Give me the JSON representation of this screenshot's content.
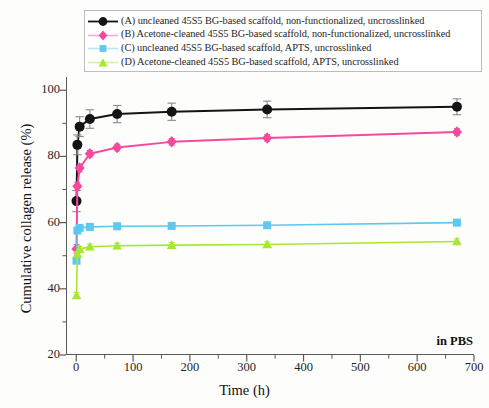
{
  "figure": {
    "background_color": "#fdfdfc",
    "axis_color": "#5a5a5a"
  },
  "annotation": {
    "in_pbs": "in PBS"
  },
  "legend": {
    "border_color": "#bdbdbd",
    "entries": [
      {
        "key": "A",
        "label": "(A) uncleaned 45S5 BG-based scaffold, non-functionalized, uncrosslinked",
        "color": "#141414",
        "marker": "circle"
      },
      {
        "key": "B",
        "label": "(B) Acetone-cleaned 45S5 BG-based scaffold, non-functionalized, uncrosslinked",
        "color": "#f54a9c",
        "marker": "diamond"
      },
      {
        "key": "C",
        "label": "(C) uncleaned 45S5 BG-based scaffold, APTS, uncrosslinked",
        "color": "#5ec8f0",
        "marker": "square"
      },
      {
        "key": "D",
        "label": "(D) Acetone-cleaned 45S5 BG-based scaffold, APTS, uncrosslinked",
        "color": "#a6e831",
        "marker": "triangle"
      }
    ]
  },
  "chart_data": {
    "type": "line",
    "title": "",
    "xlabel": "Time (h)",
    "ylabel": "Cumulative collagen release (%)",
    "xlim": [
      -18,
      700
    ],
    "ylim": [
      20,
      104
    ],
    "xticks": [
      0,
      100,
      200,
      300,
      400,
      500,
      600,
      700
    ],
    "yticks": [
      20,
      40,
      60,
      80,
      100
    ],
    "xminor_step": 50,
    "yminor_step": 10,
    "grid": false,
    "legend_position": "above-plot",
    "x": [
      0.5,
      2,
      6,
      24,
      72,
      168,
      336,
      670
    ],
    "series": [
      {
        "name": "(A) uncleaned 45S5 BG-based scaffold, non-functionalized, uncrosslinked",
        "key": "A",
        "color": "#141414",
        "marker": "circle",
        "values": [
          66.5,
          83.5,
          89.0,
          91.3,
          92.8,
          93.5,
          94.2,
          95.0
        ],
        "errors": [
          3.2,
          3.0,
          3.0,
          2.8,
          2.6,
          2.6,
          2.5,
          2.4
        ]
      },
      {
        "name": "(B) Acetone-cleaned 45S5 BG-based scaffold, non-functionalized, uncrosslinked",
        "key": "B",
        "color": "#f54a9c",
        "marker": "diamond",
        "values": [
          52.0,
          71.0,
          76.5,
          80.8,
          82.7,
          84.4,
          85.6,
          87.4
        ],
        "errors": [
          1.4,
          1.2,
          1.2,
          1.0,
          1.0,
          1.0,
          1.0,
          1.0
        ]
      },
      {
        "name": "(C) uncleaned 45S5 BG-based scaffold, APTS, uncrosslinked",
        "key": "C",
        "color": "#5ec8f0",
        "marker": "square",
        "values": [
          48.5,
          57.6,
          58.4,
          58.7,
          58.9,
          59.0,
          59.2,
          60.0
        ],
        "errors": [
          0.9,
          0.8,
          0.8,
          0.8,
          0.8,
          0.8,
          0.8,
          0.8
        ]
      },
      {
        "name": "(D) Acetone-cleaned 45S5 BG-based scaffold, APTS, uncrosslinked",
        "key": "D",
        "color": "#a6e831",
        "marker": "triangle",
        "values": [
          38.0,
          50.5,
          52.0,
          52.7,
          53.0,
          53.2,
          53.4,
          54.3
        ],
        "errors": [
          0.9,
          0.8,
          0.8,
          0.8,
          0.8,
          0.8,
          0.8,
          0.8
        ]
      }
    ]
  }
}
